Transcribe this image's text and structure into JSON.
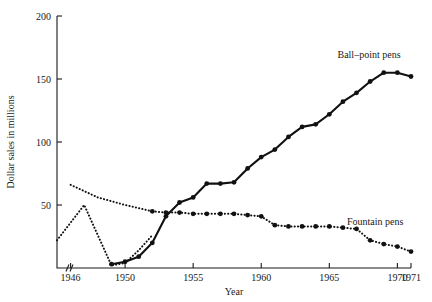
{
  "chart_data": {
    "type": "line",
    "title": "",
    "xlabel": "Year",
    "ylabel": "Dollar sales in millions",
    "xlim": [
      1945,
      1971
    ],
    "ylim": [
      0,
      200
    ],
    "ytick_labels": [
      "50",
      "100",
      "150",
      "200"
    ],
    "ytick_values": [
      50,
      100,
      150,
      200
    ],
    "xtick_labels": [
      "1946",
      "1950",
      "1955",
      "1960",
      "1965",
      "1970",
      "1971"
    ],
    "xtick_values": [
      1946,
      1950,
      1955,
      1960,
      1965,
      1970,
      1971
    ],
    "grid": false,
    "axis_break": "//",
    "legend_position": "inline-right",
    "series": [
      {
        "name": "Ball-point pens",
        "label": "Ball–point pens",
        "style": "solid",
        "marker": "filled-circle",
        "x": [
          1949,
          1950,
          1951,
          1952,
          1953,
          1954,
          1955,
          1956,
          1957,
          1958,
          1959,
          1960,
          1961,
          1962,
          1963,
          1964,
          1965,
          1966,
          1967,
          1968,
          1969,
          1970,
          1971
        ],
        "values": [
          3,
          5,
          9,
          20,
          41,
          52,
          56,
          67,
          67,
          68,
          79,
          88,
          94,
          104,
          112,
          114,
          122,
          132,
          139,
          148,
          155,
          155,
          152
        ]
      },
      {
        "name": "Fountain pens",
        "label": "Fountain pens",
        "style": "dotted",
        "marker": "filled-circle",
        "x": [
          1952,
          1953,
          1954,
          1955,
          1956,
          1957,
          1958,
          1959,
          1960,
          1961,
          1962,
          1963,
          1964,
          1965,
          1966,
          1967,
          1968,
          1969,
          1970,
          1971
        ],
        "values": [
          45,
          44,
          44,
          43,
          43,
          43,
          43,
          42,
          41,
          34,
          33,
          33,
          33,
          33,
          32,
          31,
          22,
          19,
          17,
          13
        ]
      },
      {
        "name": "Fountain pens early peak",
        "label": "",
        "style": "dotted",
        "marker": "none",
        "x": [
          1945,
          1947,
          1949,
          1950,
          1951,
          1952
        ],
        "values": [
          22,
          50,
          2,
          4,
          14,
          26
        ]
      },
      {
        "name": "Fountain pens early decline",
        "label": "",
        "style": "dotted",
        "marker": "none",
        "x": [
          1946,
          1948,
          1950,
          1952
        ],
        "values": [
          66,
          56,
          50,
          45
        ]
      }
    ]
  }
}
